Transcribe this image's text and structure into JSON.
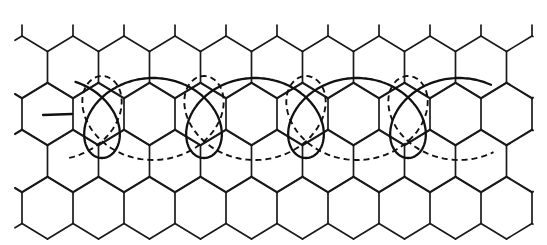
{
  "figure": {
    "description": "Hexagonal (honeycomb) lattice with two overlaid looping trochoid-like curves, one solid and one dashed",
    "colors": {
      "background": "#ffffff",
      "ink": "#1a1a1a"
    },
    "lattice": {
      "type": "hexagonal",
      "orientation": "pointy-top",
      "cell_width": 51,
      "side_length": 31,
      "row_pitch": 47,
      "origin_x": 22,
      "first_top_vertex_y": 36,
      "rows": 4,
      "x_min": 15,
      "x_max": 533
    },
    "curves": [
      {
        "name": "solid-curve",
        "style": "solid",
        "loop_direction": "down",
        "loop_x": [
          102,
          205,
          305,
          407
        ],
        "loop_bottom_y": 158,
        "arc_peak_x": [
          155,
          257,
          357,
          458
        ],
        "arc_peak_y": 78
      },
      {
        "name": "dashed-curve",
        "style": "dashed",
        "loop_direction": "up",
        "loop_x": [
          100,
          205,
          307,
          407
        ],
        "loop_top_y": 75,
        "arc_trough_x": [
          150,
          255,
          355,
          458
        ],
        "arc_trough_y": 160
      }
    ]
  }
}
